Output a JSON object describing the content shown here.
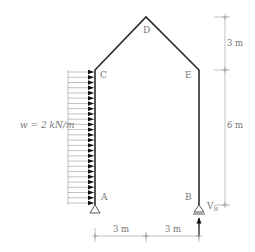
{
  "diagram": {
    "type": "structural-frame",
    "nodes": {
      "A": {
        "label": "A",
        "x": 95,
        "y": 205
      },
      "B": {
        "label": "B",
        "x": 199,
        "y": 205
      },
      "C": {
        "label": "C",
        "x": 95,
        "y": 70
      },
      "D": {
        "label": "D",
        "x": 146,
        "y": 17
      },
      "E": {
        "label": "E",
        "x": 199,
        "y": 70
      }
    },
    "members": [
      [
        "A",
        "C"
      ],
      [
        "C",
        "D"
      ],
      [
        "D",
        "E"
      ],
      [
        "E",
        "B"
      ]
    ],
    "supports": {
      "A": "pin",
      "B": "roller"
    },
    "load": {
      "label": "w = 2 kN/m",
      "type": "uniform-distributed",
      "applied_on": "A-C",
      "direction": "right",
      "arrow_count": 26
    },
    "reaction": {
      "label": "V",
      "subscript": "B",
      "at": "B",
      "direction": "up"
    },
    "dimensions": {
      "vertical": [
        {
          "label": "3 m",
          "from": "D",
          "to": "C"
        },
        {
          "label": "6 m",
          "from": "C",
          "to": "A"
        }
      ],
      "horizontal": [
        {
          "label": "3 m",
          "from": "A",
          "to": "D"
        },
        {
          "label": "3 m",
          "from": "D",
          "to": "B"
        }
      ]
    }
  }
}
